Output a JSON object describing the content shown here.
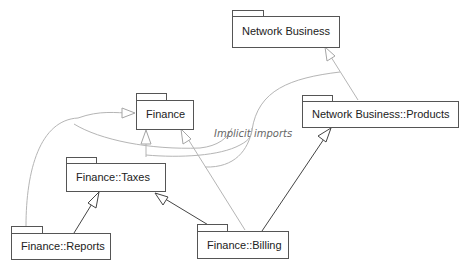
{
  "diagram": {
    "type": "UML package diagram",
    "packages": [
      {
        "id": "network_business",
        "label": "Network Business"
      },
      {
        "id": "finance",
        "label": "Finance"
      },
      {
        "id": "network_business_products",
        "label": "Network Business::Products"
      },
      {
        "id": "finance_taxes",
        "label": "Finance::Taxes"
      },
      {
        "id": "finance_reports",
        "label": "Finance::Reports"
      },
      {
        "id": "finance_billing",
        "label": "Finance::Billing"
      }
    ],
    "annotation": {
      "label": "Implicit imports"
    },
    "dependencies": [
      {
        "from": "Finance::Taxes",
        "to": "Finance",
        "style": "implicit"
      },
      {
        "from": "Finance::Reports",
        "to": "Finance",
        "style": "implicit"
      },
      {
        "from": "Finance::Billing",
        "to": "Finance",
        "style": "implicit"
      },
      {
        "from": "Network Business::Products",
        "to": "Network Business",
        "style": "implicit"
      },
      {
        "from": "Finance::Reports",
        "to": "Finance::Taxes",
        "style": "explicit"
      },
      {
        "from": "Finance::Billing",
        "to": "Finance::Taxes",
        "style": "explicit"
      },
      {
        "from": "Finance::Billing",
        "to": "Network Business::Products",
        "style": "explicit"
      }
    ],
    "colors": {
      "box_stroke": "#555555",
      "explicit_line": "#444444",
      "implicit_line": "#b5b5b5",
      "annotation_text": "#666666"
    }
  }
}
